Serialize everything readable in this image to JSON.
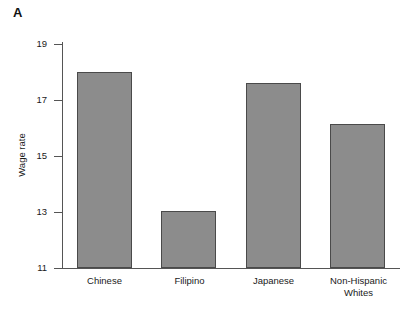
{
  "figure": {
    "panel_letter": "A",
    "bar_fill_color": "#8c8c8c",
    "bar_edge_color": "#4a4a4a",
    "axis_color": "#555555",
    "background_color": "#ffffff"
  },
  "chart_data": {
    "type": "bar",
    "title": "",
    "subtitle": "",
    "xlabel": "",
    "ylabel": "Wage rate",
    "categories": [
      "Chinese",
      "Filipino",
      "Japanese",
      "Non-Hispanic Whites"
    ],
    "category_labels": [
      "Chinese",
      "Filipino",
      "Japanese",
      "Non-Hispanic\nWhites"
    ],
    "values": [
      18.0,
      13.05,
      17.6,
      16.15
    ],
    "ylim": [
      11,
      19
    ],
    "yticks": [
      11,
      13,
      15,
      17,
      19
    ],
    "ytick_labels": [
      "11",
      "13",
      "15",
      "17",
      "19"
    ],
    "xticks": [],
    "grid": false,
    "legend": false,
    "legend_position": "none",
    "annotations": [
      "A"
    ]
  }
}
